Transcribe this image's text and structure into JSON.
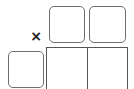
{
  "board": {
    "top_tiles": [
      {
        "id": "tile-top-1",
        "label": ""
      },
      {
        "id": "tile-top-2",
        "label": ""
      }
    ],
    "left_tile": {
      "id": "tile-left",
      "label": ""
    },
    "grid_cells": [
      {
        "id": "cell-1",
        "label": ""
      },
      {
        "id": "cell-2",
        "label": ""
      }
    ],
    "close_glyph": "×"
  },
  "colors": {
    "tile_border": "#6e6e6e",
    "grid_border": "#555555",
    "mark": "#222222"
  }
}
